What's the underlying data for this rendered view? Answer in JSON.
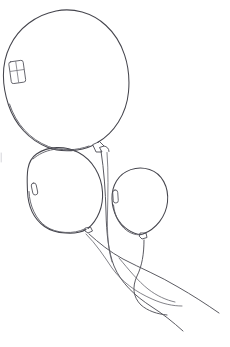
{
  "artwork": {
    "title": "Three Balloons",
    "medium": "line drawing",
    "background_color": "#ffffff",
    "ink_color": "#4a4a52",
    "canvas": {
      "width": 230,
      "height": 347
    }
  },
  "balloons": [
    {
      "id": "large-balloon",
      "label": "Large balloon (upper left)",
      "center": {
        "x": 66,
        "y": 79
      },
      "radius": {
        "x": 63,
        "y": 70
      },
      "knot": {
        "x": 101,
        "y": 146
      },
      "highlight": {
        "type": "four-pane-window",
        "x": 10,
        "y": 61,
        "width": 15,
        "height": 22,
        "rotation": -8
      }
    },
    {
      "id": "middle-balloon",
      "label": "Middle balloon (center left)",
      "center": {
        "x": 65,
        "y": 190
      },
      "radius": {
        "x": 38,
        "y": 42
      },
      "knot": {
        "x": 89,
        "y": 230
      },
      "highlight": {
        "type": "rounded-bar",
        "x": 32,
        "y": 183,
        "width": 5,
        "height": 12,
        "rotation": -10
      }
    },
    {
      "id": "right-balloon",
      "label": "Small balloon (right)",
      "center": {
        "x": 140,
        "y": 203
      },
      "radius": {
        "x": 28,
        "y": 32
      },
      "knot": {
        "x": 144,
        "y": 236
      },
      "highlight": {
        "type": "rounded-bar",
        "x": 113,
        "y": 190,
        "width": 5,
        "height": 13,
        "rotation": -4
      }
    }
  ],
  "strings": [
    {
      "id": "string-large-balloon",
      "label": "String from large balloon",
      "from": {
        "x": 101,
        "y": 152
      },
      "to": {
        "x": 183,
        "y": 330
      }
    },
    {
      "id": "string-middle-balloon",
      "label": "String from middle balloon",
      "from": {
        "x": 89,
        "y": 234
      },
      "to": {
        "x": 219,
        "y": 312
      }
    },
    {
      "id": "string-right-balloon",
      "label": "String from right balloon",
      "from": {
        "x": 144,
        "y": 240
      },
      "to": {
        "x": 167,
        "y": 314
      }
    }
  ],
  "marks": {
    "left_edge_artifact": {
      "x": 1,
      "y": 153,
      "height": 9
    }
  }
}
